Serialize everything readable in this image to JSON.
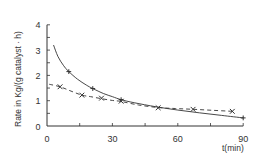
{
  "chart_data": {
    "type": "line",
    "title": "",
    "xlabel": "t(min)",
    "ylabel": "Rate in Kg/(g catalyst · h)",
    "xlim": [
      0,
      90
    ],
    "ylim": [
      0,
      4
    ],
    "x_ticks": [
      0,
      30,
      60,
      90
    ],
    "x_minor_ticks": [
      15,
      45,
      75
    ],
    "y_ticks": [
      0,
      1,
      2,
      3,
      4
    ],
    "y_minor_ticks": [
      0.5,
      1.5,
      2.5,
      3.5
    ],
    "grid": false,
    "legend": null,
    "series": [
      {
        "name": "solid",
        "line_style": "solid",
        "marker": "+",
        "points": [
          [
            10,
            2.15
          ],
          [
            21,
            1.48
          ],
          [
            34,
            1.04
          ],
          [
            90,
            0.32
          ]
        ],
        "curve": [
          [
            3,
            3.2
          ],
          [
            5,
            2.75
          ],
          [
            7.5,
            2.4
          ],
          [
            10,
            2.15
          ],
          [
            14,
            1.85
          ],
          [
            18,
            1.62
          ],
          [
            21,
            1.48
          ],
          [
            26,
            1.28
          ],
          [
            30,
            1.16
          ],
          [
            34,
            1.04
          ],
          [
            40,
            0.92
          ],
          [
            50,
            0.76
          ],
          [
            60,
            0.63
          ],
          [
            70,
            0.52
          ],
          [
            80,
            0.42
          ],
          [
            90,
            0.32
          ]
        ]
      },
      {
        "name": "dashed",
        "line_style": "dashed",
        "marker": "x",
        "points": [
          [
            6,
            1.55
          ],
          [
            16,
            1.22
          ],
          [
            25,
            1.1
          ],
          [
            34,
            0.98
          ],
          [
            51,
            0.72
          ],
          [
            67,
            0.66
          ],
          [
            85,
            0.58
          ]
        ],
        "curve": [
          [
            1,
            1.65
          ],
          [
            6,
            1.55
          ],
          [
            11,
            1.38
          ],
          [
            16,
            1.22
          ],
          [
            20,
            1.16
          ],
          [
            25,
            1.08
          ],
          [
            30,
            1.01
          ],
          [
            34,
            0.97
          ],
          [
            42,
            0.83
          ],
          [
            51,
            0.73
          ],
          [
            59,
            0.69
          ],
          [
            67,
            0.66
          ],
          [
            76,
            0.62
          ],
          [
            85,
            0.58
          ]
        ]
      }
    ]
  },
  "labels": {
    "x_tick_labels": [
      "0",
      "30",
      "60",
      "90"
    ],
    "y_tick_labels": [
      "0",
      "1",
      "2",
      "3",
      "4"
    ],
    "x_title": "t(min)",
    "y_title": "Rate in Kg/(g catalyst · h)"
  }
}
